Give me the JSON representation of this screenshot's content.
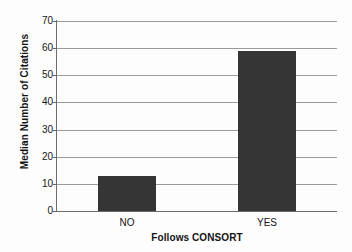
{
  "chart_data": {
    "type": "bar",
    "title": "",
    "categories": [
      "NO",
      "YES"
    ],
    "values": [
      13,
      59
    ],
    "xlabel": "Follows CONSORT",
    "ylabel": "Median Number of Citations",
    "ylim": [
      0,
      70
    ],
    "ytick_labels": [
      "0",
      "10",
      "20",
      "30",
      "40",
      "50",
      "60",
      "70"
    ],
    "ytick_values": [
      0,
      10,
      20,
      30,
      40,
      50,
      60,
      70
    ],
    "grid": true,
    "legend": "none",
    "series": [
      {
        "name": "Median Number of Citations",
        "values": [
          13,
          59
        ]
      }
    ]
  },
  "style": {
    "bar_color": "#353535",
    "grid_color": "#9a9a9a",
    "axis_color": "#6b6b6b",
    "text_color": "#141414",
    "background": "#fdfdfd"
  }
}
